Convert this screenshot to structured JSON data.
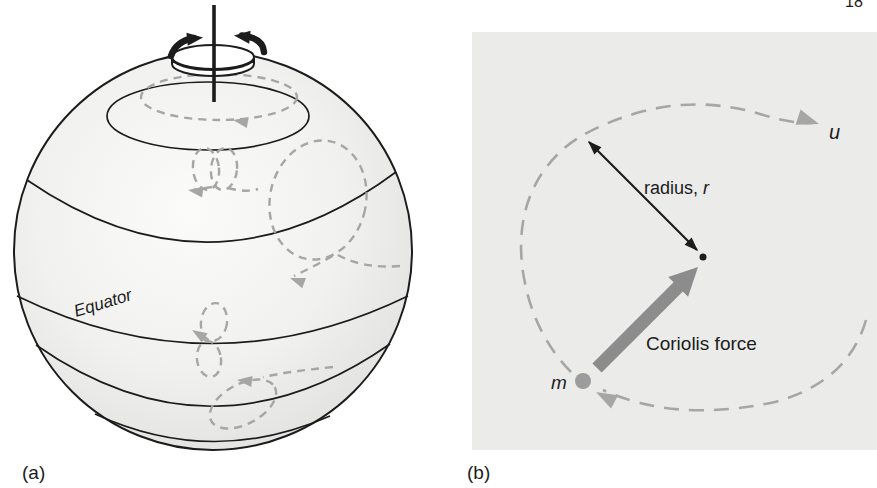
{
  "page": {
    "page_number_fragment": "18"
  },
  "panel_a": {
    "label": "(a)",
    "equator_label": "Equator"
  },
  "panel_b": {
    "label": "(b)",
    "velocity_label": "u",
    "radius_label": "radius, ",
    "radius_symbol": "r",
    "coriolis_force_label": "Coriolis force",
    "mass_symbol": "m"
  },
  "colors": {
    "ink": "#1c1c1c",
    "dashed_path_gray": "#a6a6a6",
    "coriolis_arrow_gray": "#8c8c8c",
    "mass_dot_gray": "#9c9c9c",
    "panel_b_background": "#ebebea",
    "sphere_edge_shade": "#cfcfcd"
  }
}
